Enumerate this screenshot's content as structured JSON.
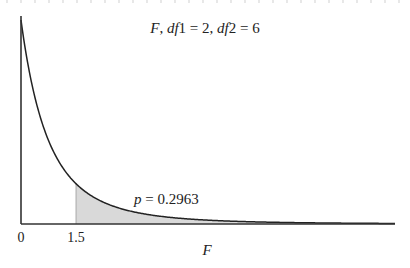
{
  "chart_data": {
    "type": "area",
    "title": "F, df1 = 2, df2 = 6",
    "title_parts": {
      "var": "F",
      "sep1": ", ",
      "df1_label": "df",
      "df1_index": "1",
      "df1_value": " = 2",
      "sep2": ", ",
      "df2_label": "df",
      "df2_index": "2",
      "df2_value": " = 6"
    },
    "distribution": "F",
    "df1": 2,
    "df2": 6,
    "xlabel": "F",
    "ylabel": "",
    "x_ticks": [
      {
        "value": 0,
        "label": "0"
      },
      {
        "value": 1.5,
        "label": "1.5"
      }
    ],
    "xlim": [
      0,
      10.2
    ],
    "ylim": [
      0,
      1.0
    ],
    "grid": false,
    "legend": null,
    "shaded_region": {
      "from": 1.5,
      "to": 10.2,
      "color": "#d9d9d9"
    },
    "annotation": {
      "p_label": "p",
      "equals": " = ",
      "p_value": "0.2963",
      "text": "p = 0.2963",
      "x": 3.0,
      "y": 0.12
    },
    "critical_value": 1.5,
    "curve_color": "#222222",
    "axis_color": "#333333",
    "pdf_samples": [
      {
        "x": 0.0,
        "y": 1.0
      },
      {
        "x": 0.5,
        "y": 0.5398
      },
      {
        "x": 1.0,
        "y": 0.3164
      },
      {
        "x": 1.5,
        "y": 0.1975
      },
      {
        "x": 2.0,
        "y": 0.1296
      },
      {
        "x": 3.0,
        "y": 0.0625
      },
      {
        "x": 4.0,
        "y": 0.0337
      },
      {
        "x": 5.0,
        "y": 0.0198
      },
      {
        "x": 6.0,
        "y": 0.0123
      },
      {
        "x": 8.0,
        "y": 0.0053
      },
      {
        "x": 10.0,
        "y": 0.0026
      }
    ]
  }
}
